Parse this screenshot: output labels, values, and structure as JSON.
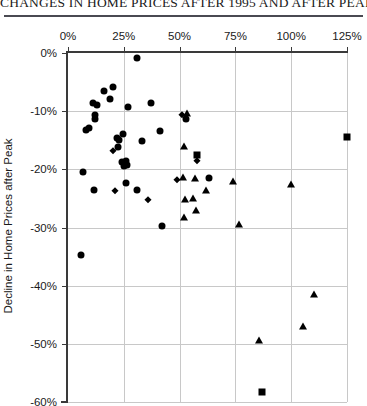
{
  "chart_data": {
    "type": "scatter",
    "title": "CHANGES IN HOME PRICES AFTER 1995 AND AFTER PEAK",
    "xlabel": "",
    "ylabel": "Decline in Home Prices after Peak",
    "xlim": [
      0,
      125
    ],
    "ylim": [
      -60,
      0
    ],
    "x_ticks": [
      "0%",
      "25%",
      "50%",
      "75%",
      "100%",
      "125%"
    ],
    "x_tick_values": [
      0,
      25,
      50,
      75,
      100,
      125
    ],
    "y_ticks": [
      "0%",
      "-10%",
      "-20%",
      "-30%",
      "-40%",
      "-50%",
      "-60%"
    ],
    "y_tick_values": [
      0,
      -10,
      -20,
      -30,
      -40,
      -50,
      -60
    ],
    "x_axis_position": "top",
    "grid": true,
    "legend": "none",
    "series": [
      {
        "name": "circle-series",
        "marker": "circle",
        "points": [
          [
            31.0,
            -0.8
          ],
          [
            8.0,
            -13.2
          ],
          [
            11.0,
            -8.6
          ],
          [
            13.0,
            -9.0
          ],
          [
            12.0,
            -10.6
          ],
          [
            12.0,
            -11.4
          ],
          [
            16.0,
            -6.6
          ],
          [
            19.0,
            -7.9
          ],
          [
            20.0,
            -5.9
          ],
          [
            9.5,
            -12.9
          ],
          [
            27.0,
            -9.3
          ],
          [
            37.0,
            -8.6
          ],
          [
            22.0,
            -14.6
          ],
          [
            23.0,
            -15.0
          ],
          [
            24.5,
            -14.0
          ],
          [
            22.5,
            -16.2
          ],
          [
            24.0,
            -18.8
          ],
          [
            25.0,
            -19.5
          ],
          [
            25.8,
            -18.6
          ],
          [
            26.5,
            -19.2
          ],
          [
            33.0,
            -15.2
          ],
          [
            41.0,
            -13.4
          ],
          [
            53.0,
            -11.3
          ],
          [
            6.5,
            -20.5
          ],
          [
            11.5,
            -23.5
          ],
          [
            6.0,
            -34.8
          ],
          [
            26.0,
            -22.3
          ],
          [
            31.0,
            -23.6
          ],
          [
            42.0,
            -29.8
          ],
          [
            63.0,
            -21.5
          ]
        ]
      },
      {
        "name": "diamond-series",
        "marker": "diamond",
        "points": [
          [
            20.0,
            -16.8
          ],
          [
            21.0,
            -23.8
          ],
          [
            36.0,
            -25.3
          ],
          [
            51.0,
            -10.6
          ],
          [
            49.0,
            -21.9
          ],
          [
            58.0,
            -18.6
          ]
        ]
      },
      {
        "name": "triangle-series",
        "marker": "triangle",
        "points": [
          [
            53.5,
            -10.3
          ],
          [
            52.0,
            -16.0
          ],
          [
            51.5,
            -21.4
          ],
          [
            57.0,
            -21.5
          ],
          [
            52.5,
            -25.1
          ],
          [
            56.0,
            -25.0
          ],
          [
            52.0,
            -28.2
          ],
          [
            57.5,
            -27.0
          ],
          [
            62.0,
            -23.6
          ],
          [
            74.0,
            -22.0
          ],
          [
            76.5,
            -29.4
          ],
          [
            100.0,
            -22.6
          ],
          [
            110.0,
            -41.4
          ],
          [
            105.5,
            -46.9
          ],
          [
            85.5,
            -49.4
          ]
        ]
      },
      {
        "name": "square-series",
        "marker": "square",
        "points": [
          [
            58.0,
            -17.6
          ],
          [
            125.0,
            -14.5
          ],
          [
            87.0,
            -58.2
          ]
        ]
      }
    ]
  }
}
